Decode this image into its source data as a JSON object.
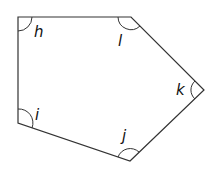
{
  "diagram": {
    "type": "pentagon-angles",
    "stroke_color": "#333333",
    "vertices": [
      {
        "name": "top-left",
        "x": 18,
        "y": 17,
        "angle_label": "h"
      },
      {
        "name": "top-right",
        "x": 131,
        "y": 17,
        "angle_label": "l"
      },
      {
        "name": "right",
        "x": 204,
        "y": 90,
        "angle_label": "k"
      },
      {
        "name": "bottom",
        "x": 130,
        "y": 161,
        "angle_label": "j"
      },
      {
        "name": "bottom-left",
        "x": 18,
        "y": 123,
        "angle_label": "i"
      }
    ],
    "labels": {
      "h": "h",
      "l": "l",
      "k": "k",
      "j": "j",
      "i": "i"
    }
  }
}
